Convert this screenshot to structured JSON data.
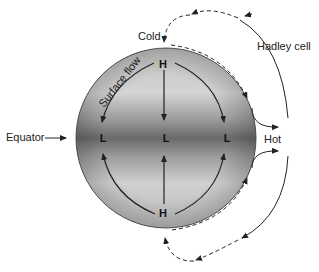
{
  "diagram": {
    "labels": {
      "cold": "Cold",
      "hot": "Hot",
      "equator": "Equator",
      "hadley_cell": "Hadley cell",
      "surface_flow": "Surface flow"
    },
    "pressure": {
      "north_pole": "H",
      "south_pole": "H",
      "equator_left": "L",
      "equator_center": "L",
      "equator_right": "L"
    },
    "colors": {
      "sphere_light": "#d6d6d6",
      "sphere_dark": "#6e6e6e",
      "sphere_edge": "#555555",
      "arrow": "#222222",
      "background": "#ffffff"
    }
  }
}
